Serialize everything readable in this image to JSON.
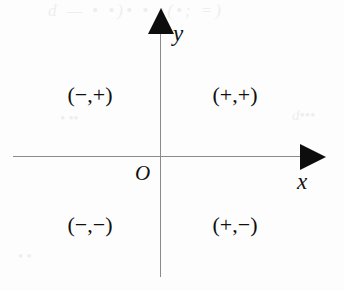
{
  "figure": {
    "background_color": "#fdfdfd",
    "axis_color": "#8b8b8b",
    "ink_color": "#101010"
  },
  "axes": {
    "x_label": "x",
    "y_label": "y",
    "origin_label": "O",
    "x_arrow_direction": "right",
    "y_arrow_direction": "up"
  },
  "quadrants": {
    "q1": "(+,+)",
    "q2": "(−,+)",
    "q3": "(−,−)",
    "q4": "(+,−)"
  },
  "artifacts": {
    "top": "d         —  •   •)• • •(•;    =)",
    "right": "d•••",
    "mid": "•  ••",
    "low": "• •"
  },
  "chart_data": {
    "type": "scatter",
    "xlabel": "x",
    "ylabel": "y",
    "xlim": [
      -1,
      1
    ],
    "ylim": [
      -1,
      1
    ],
    "grid": false,
    "legend": "none",
    "origin_label": "O",
    "annotations": [
      {
        "text": "(+,+)",
        "quadrant": 1,
        "x": 0.45,
        "y": 0.5
      },
      {
        "text": "(−,+)",
        "quadrant": 2,
        "x": -0.5,
        "y": 0.5
      },
      {
        "text": "(−,−)",
        "quadrant": 3,
        "x": -0.5,
        "y": -0.55
      },
      {
        "text": "(+,−)",
        "quadrant": 4,
        "x": 0.45,
        "y": -0.55
      }
    ],
    "series": []
  }
}
